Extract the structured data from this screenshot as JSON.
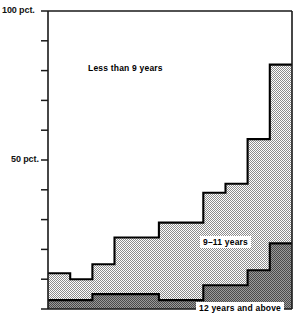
{
  "chart_data": {
    "type": "area",
    "title": "",
    "subtitle": "",
    "xlabel": "",
    "ylabel": "",
    "ylim": [
      0,
      100
    ],
    "grid": false,
    "legend_position": "inline-annotations",
    "stacked": true,
    "axis": {
      "y_tick_values": [
        0,
        10,
        20,
        30,
        40,
        50,
        60,
        70,
        80,
        90,
        100
      ],
      "y_tick_labels": [
        "",
        "",
        "",
        "",
        "",
        "50 pct.",
        "",
        "",
        "",
        "",
        "100 pct."
      ],
      "y_labeled_ticks": [
        {
          "value": 100,
          "label": "100 pct."
        },
        {
          "value": 50,
          "label": "50 pct."
        }
      ],
      "x_tick_labels": [],
      "x_categories": [
        "1",
        "2",
        "3",
        "4",
        "5",
        "6",
        "7",
        "8",
        "9",
        "10",
        "11"
      ]
    },
    "series": [
      {
        "name": "12 years and above",
        "label": "12 years and above",
        "fill": "#6f6f6f",
        "order": 0,
        "values": [
          3,
          3,
          5,
          5,
          5,
          3,
          3,
          8,
          8,
          13,
          22
        ]
      },
      {
        "name": "9-11 years",
        "label": "9–11 years",
        "fill": "#c8c8c8",
        "order": 1,
        "values": [
          9,
          7,
          10,
          19,
          19,
          26,
          26,
          31,
          34,
          44,
          60
        ]
      },
      {
        "name": "Less than 9 years",
        "label": "Less than 9 years",
        "fill": "#ffffff",
        "order": 2,
        "values": [
          88,
          90,
          85,
          76,
          76,
          71,
          71,
          61,
          58,
          43,
          18
        ]
      }
    ],
    "cumulative_tops": {
      "12_years_and_above": [
        3,
        3,
        5,
        5,
        5,
        3,
        3,
        8,
        8,
        13,
        22
      ],
      "through_9_11_years": [
        12,
        10,
        15,
        24,
        24,
        29,
        29,
        39,
        42,
        57,
        82
      ]
    },
    "annotations": [
      {
        "text": "Less than 9 years",
        "area": "top-white-band"
      },
      {
        "text": "9–11 years",
        "area": "middle-gray-band"
      },
      {
        "text": "12 years and above",
        "area": "bottom-dark-band"
      }
    ]
  },
  "labels": {
    "y_top": "100 pct.",
    "y_mid": "50 pct.",
    "series_top": "Less than 9 years",
    "series_mid": "9–11 years",
    "series_bottom": "12 years and above"
  },
  "colors": {
    "axis": "#1a1a1a",
    "outline": "#000000",
    "band_top": "#ffffff",
    "band_mid": "#c8c8c8",
    "band_bottom": "#6f6f6f",
    "text": "#111111"
  }
}
